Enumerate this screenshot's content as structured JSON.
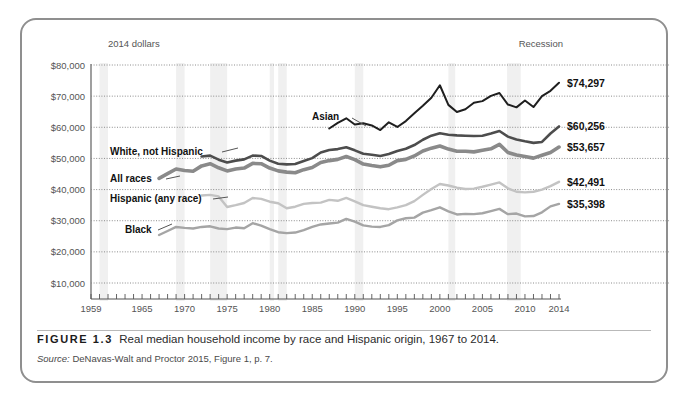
{
  "figure": {
    "tag": "FIGURE 1.3",
    "title": "Real median household income by race and Hispanic origin, 1967 to 2014.",
    "source_prefix": "Source:",
    "source_text": " DeNavas-Walt and Proctor 2015, Figure 1, p. 7."
  },
  "chart_data": {
    "type": "line",
    "title": "Real median household income by race and Hispanic origin, 1967 to 2014",
    "units_note": "2014 dollars",
    "xlabel": "",
    "ylabel": "",
    "xlim": [
      1959,
      2014
    ],
    "ylim": [
      0,
      80000
    ],
    "grid": true,
    "legend_position": "inline-labels",
    "annotations": [
      "Recession"
    ],
    "ytick_labels": [
      "$80,000",
      "$70,000",
      "$60,000",
      "$50,000",
      "$40,000",
      "$30,000",
      "$20,000",
      "$10,000"
    ],
    "ytick_values": [
      80000,
      70000,
      60000,
      50000,
      40000,
      30000,
      20000,
      10000
    ],
    "xtick_labels": [
      "1959",
      "1965",
      "1970",
      "1975",
      "1980",
      "1985",
      "1990",
      "1995",
      "2000",
      "2005",
      "2010",
      "2014"
    ],
    "xtick_values": [
      1959,
      1965,
      1970,
      1975,
      1980,
      1985,
      1990,
      1995,
      2000,
      2005,
      2010,
      2014
    ],
    "recession_bands": [
      [
        1960,
        1961
      ],
      [
        1969,
        1970
      ],
      [
        1973,
        1975
      ],
      [
        1980,
        1980.5
      ],
      [
        1981,
        1982
      ],
      [
        1990,
        1991
      ],
      [
        2001,
        2001.8
      ],
      [
        2007.9,
        2009.5
      ]
    ],
    "series": [
      {
        "name": "Asian",
        "label": "Asian",
        "end_label": "$74,297",
        "end_value": 74297,
        "color": "#1f1f1f",
        "width": 2.0,
        "x": [
          1987,
          1988,
          1989,
          1990,
          1991,
          1992,
          1993,
          1994,
          1995,
          1996,
          1997,
          1998,
          1999,
          2000,
          2001,
          2002,
          2003,
          2004,
          2005,
          2006,
          2007,
          2008,
          2009,
          2010,
          2011,
          2012,
          2013,
          2014
        ],
        "values": [
          59600,
          61400,
          62900,
          60900,
          61300,
          60600,
          59100,
          61600,
          60100,
          62000,
          64500,
          66900,
          69500,
          73500,
          67200,
          64900,
          65800,
          67900,
          68400,
          70100,
          71000,
          67300,
          66400,
          68600,
          66500,
          70000,
          71700,
          74297
        ]
      },
      {
        "name": "White, not Hispanic",
        "label": "White, not Hispanic",
        "end_label": "$60,256",
        "end_value": 60256,
        "color": "#4d4d4d",
        "width": 2.6,
        "x": [
          1972,
          1973,
          1974,
          1975,
          1976,
          1977,
          1978,
          1979,
          1980,
          1981,
          1982,
          1983,
          1984,
          1985,
          1986,
          1987,
          1988,
          1989,
          1990,
          1991,
          1992,
          1993,
          1994,
          1995,
          1996,
          1997,
          1998,
          1999,
          2000,
          2001,
          2002,
          2003,
          2004,
          2005,
          2006,
          2007,
          2008,
          2009,
          2010,
          2011,
          2012,
          2013,
          2014
        ],
        "values": [
          50600,
          50900,
          49600,
          48700,
          49300,
          49700,
          50900,
          50800,
          49300,
          48300,
          48100,
          48200,
          49200,
          50100,
          51900,
          52700,
          53000,
          53600,
          52600,
          51500,
          51200,
          50800,
          51400,
          52400,
          53100,
          54300,
          56000,
          57300,
          58100,
          57600,
          57400,
          57300,
          57200,
          57300,
          58000,
          58800,
          57000,
          56100,
          55500,
          55000,
          55300,
          58000,
          60256
        ]
      },
      {
        "name": "All races",
        "label": "All races",
        "end_label": "$53,657",
        "end_value": 53657,
        "color": "#8a8a8a",
        "width": 3.6,
        "x": [
          1967,
          1968,
          1969,
          1970,
          1971,
          1972,
          1973,
          1974,
          1975,
          1976,
          1977,
          1978,
          1979,
          1980,
          1981,
          1982,
          1983,
          1984,
          1985,
          1986,
          1987,
          1988,
          1989,
          1990,
          1991,
          1992,
          1993,
          1994,
          1995,
          1996,
          1997,
          1998,
          1999,
          2000,
          2001,
          2002,
          2003,
          2004,
          2005,
          2006,
          2007,
          2008,
          2009,
          2010,
          2011,
          2012,
          2013,
          2014
        ],
        "values": [
          43600,
          45100,
          46600,
          46100,
          45900,
          47600,
          48300,
          47000,
          46000,
          46600,
          46900,
          48400,
          48300,
          46900,
          46000,
          45600,
          45400,
          46400,
          47100,
          48700,
          49300,
          49700,
          50600,
          49600,
          48200,
          47700,
          47300,
          47800,
          49300,
          49700,
          50800,
          52400,
          53300,
          54000,
          53000,
          52300,
          52300,
          52100,
          52600,
          53100,
          54500,
          51900,
          51100,
          50600,
          50100,
          51000,
          51900,
          53657
        ]
      },
      {
        "name": "Hispanic (any race)",
        "label": "Hispanic (any race)",
        "end_label": "$42,491",
        "end_value": 42491,
        "color": "#c3c3c3",
        "width": 2.4,
        "x": [
          1972,
          1973,
          1974,
          1975,
          1976,
          1977,
          1978,
          1979,
          1980,
          1981,
          1982,
          1983,
          1984,
          1985,
          1986,
          1987,
          1988,
          1989,
          1990,
          1991,
          1992,
          1993,
          1994,
          1995,
          1996,
          1997,
          1998,
          1999,
          2000,
          2001,
          2002,
          2003,
          2004,
          2005,
          2006,
          2007,
          2008,
          2009,
          2010,
          2011,
          2012,
          2013,
          2014
        ],
        "values": [
          38100,
          38300,
          37800,
          34400,
          35000,
          35700,
          37300,
          37000,
          36100,
          35600,
          34000,
          34500,
          35400,
          35700,
          35800,
          36700,
          36400,
          37300,
          36200,
          35000,
          34500,
          34000,
          33700,
          34300,
          35000,
          36300,
          38300,
          40200,
          41800,
          41300,
          40600,
          40200,
          40300,
          40900,
          41600,
          42300,
          40400,
          39300,
          39100,
          39300,
          40000,
          41100,
          42491
        ]
      },
      {
        "name": "Black",
        "label": "Black",
        "end_label": "$35,398",
        "end_value": 35398,
        "color": "#a5a5a5",
        "width": 2.4,
        "x": [
          1967,
          1968,
          1969,
          1970,
          1971,
          1972,
          1973,
          1974,
          1975,
          1976,
          1977,
          1978,
          1979,
          1980,
          1981,
          1982,
          1983,
          1984,
          1985,
          1986,
          1987,
          1988,
          1989,
          1990,
          1991,
          1992,
          1993,
          1994,
          1995,
          1996,
          1997,
          1998,
          1999,
          2000,
          2001,
          2002,
          2003,
          2004,
          2005,
          2006,
          2007,
          2008,
          2009,
          2010,
          2011,
          2012,
          2013,
          2014
        ],
        "values": [
          25400,
          26700,
          28000,
          27700,
          27500,
          28000,
          28200,
          27500,
          27300,
          27800,
          27600,
          29200,
          28400,
          27300,
          26300,
          26000,
          26200,
          27000,
          28000,
          28800,
          29100,
          29400,
          30600,
          29700,
          28500,
          28100,
          28000,
          28600,
          30100,
          30800,
          31000,
          32600,
          33400,
          34300,
          33000,
          32000,
          32200,
          32100,
          32400,
          33100,
          33800,
          32100,
          32300,
          31400,
          31500,
          32700,
          34600,
          35398
        ]
      }
    ]
  }
}
